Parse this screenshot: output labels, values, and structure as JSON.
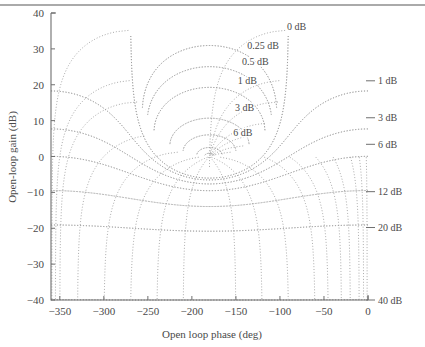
{
  "figure": {
    "kind": "nichols-chart",
    "background_color": "#ffffff",
    "grid_color": "#9a9a9a",
    "axis_color": "#6f6f6f",
    "text_color": "#4a4a4a",
    "page_rule_visible": true
  },
  "chart_data": {
    "type": "line",
    "title": "",
    "subtitle": "",
    "xlabel": "Open loop phase (deg)",
    "ylabel": "Open-loop gain (dB)",
    "xlim": [
      -360,
      0
    ],
    "ylim": [
      -40,
      40
    ],
    "xticks": [
      -350,
      -300,
      -250,
      -200,
      -150,
      -100,
      -50,
      0
    ],
    "xtick_labels": [
      "-350",
      "-300",
      "-250",
      "-200",
      "-150",
      "-100",
      "-50",
      "0"
    ],
    "yticks": [
      -40,
      -30,
      -20,
      -10,
      0,
      10,
      20,
      30,
      40
    ],
    "ytick_labels": [
      "-40",
      "-30",
      "-20",
      "-10",
      "0",
      "10",
      "20",
      "30",
      "40"
    ],
    "grid": true,
    "grid_style": "dotted",
    "legend": "none",
    "series": [
      {
        "name": "closed-loop magnitude contours (dB)",
        "kind": "m-circles",
        "values": [
          0,
          0.25,
          0.5,
          1,
          3,
          6,
          12,
          20,
          40,
          -1,
          -3,
          -6,
          -12,
          -20,
          -40
        ]
      },
      {
        "name": "closed-loop phase contours (deg)",
        "kind": "n-circles",
        "values": [
          -1,
          -5,
          -10,
          -20,
          -30,
          -45,
          -60,
          -90,
          -120,
          -150,
          -180,
          -210,
          -240,
          -270,
          -300,
          -330,
          -350,
          -355,
          -359
        ]
      }
    ],
    "annotations": [
      {
        "text": "0 dB",
        "x": -92,
        "y": 36.2,
        "anchor": "start",
        "leader": false,
        "placement": "interior"
      },
      {
        "text": "0.25 dB",
        "x": -137,
        "y": 31.0,
        "anchor": "start",
        "leader": false,
        "placement": "interior"
      },
      {
        "text": "0.5 dB",
        "x": -143,
        "y": 26.5,
        "anchor": "start",
        "leader": false,
        "placement": "interior"
      },
      {
        "text": "1 dB",
        "x": -148,
        "y": 21.2,
        "anchor": "start",
        "leader": false,
        "placement": "interior"
      },
      {
        "text": "3 dB",
        "x": -151,
        "y": 13.6,
        "anchor": "start",
        "leader": false,
        "placement": "interior"
      },
      {
        "text": "6 dB",
        "x": -153,
        "y": 6.6,
        "anchor": "start",
        "leader": false,
        "placement": "interior"
      },
      {
        "text": "1 dB",
        "x": 0,
        "y": 21.1,
        "anchor": "start",
        "leader": true,
        "placement": "right-margin"
      },
      {
        "text": "3 dB",
        "x": 0,
        "y": 10.8,
        "anchor": "start",
        "leader": true,
        "placement": "right-margin"
      },
      {
        "text": "6 dB",
        "x": 0,
        "y": 3.4,
        "anchor": "start",
        "leader": true,
        "placement": "right-margin"
      },
      {
        "text": "12 dB",
        "x": 0,
        "y": -9.8,
        "anchor": "start",
        "leader": true,
        "placement": "right-margin"
      },
      {
        "text": "20 dB",
        "x": 0,
        "y": -19.8,
        "anchor": "start",
        "leader": true,
        "placement": "right-margin"
      },
      {
        "text": "40 dB",
        "x": 0,
        "y": -40.0,
        "anchor": "start",
        "leader": true,
        "placement": "right-margin"
      }
    ]
  }
}
